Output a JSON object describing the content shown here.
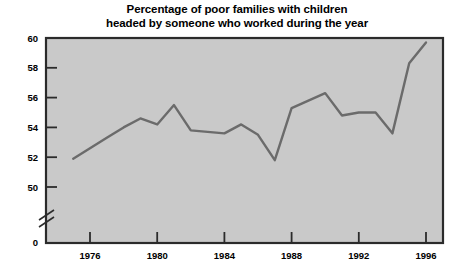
{
  "chart_data": {
    "type": "line",
    "title": "Percentage of poor families with children headed by someone who worked during the year",
    "title_line1": "Percentage of poor families with children",
    "title_line2": "headed by someone who worked during the year",
    "xlabel": "",
    "ylabel": "",
    "x": [
      1975,
      1976,
      1977,
      1978,
      1979,
      1980,
      1981,
      1982,
      1983,
      1984,
      1985,
      1986,
      1987,
      1988,
      1989,
      1990,
      1991,
      1992,
      1993,
      1994,
      1995,
      1996
    ],
    "values": [
      51.9,
      52.6,
      53.3,
      54.0,
      54.6,
      54.2,
      55.5,
      53.8,
      53.7,
      53.6,
      54.2,
      53.5,
      51.8,
      55.3,
      55.8,
      56.3,
      54.8,
      55.0,
      55.0,
      53.6,
      58.3,
      59.7
    ],
    "series": [
      {
        "name": "Percentage of poor families with children headed by someone who worked",
        "values": [
          51.9,
          52.6,
          53.3,
          54.0,
          54.6,
          54.2,
          55.5,
          53.8,
          53.7,
          53.6,
          54.2,
          53.5,
          51.8,
          55.3,
          55.8,
          56.3,
          54.8,
          55.0,
          55.0,
          53.6,
          58.3,
          59.7
        ]
      }
    ],
    "ytick_labels": [
      "60",
      "58",
      "56",
      "54",
      "52",
      "50",
      "0"
    ],
    "ytick_values": [
      60,
      58,
      56,
      54,
      52,
      50,
      0
    ],
    "xtick_labels": [
      "1976",
      "1980",
      "1984",
      "1988",
      "1992",
      "1996"
    ],
    "xtick_values": [
      1976,
      1980,
      1984,
      1988,
      1992,
      1996
    ],
    "ylim": [
      50,
      60
    ],
    "xlim": [
      1975,
      1996
    ],
    "axis_break": true,
    "axis_break_label": "0",
    "grid": false,
    "legend": "none",
    "line_color": "#6b6b6b",
    "plot_background_color": "#c9c9c9",
    "axis_color": "#2b2b2b",
    "page_background_color": "#ffffff",
    "text_color": "#000000"
  }
}
